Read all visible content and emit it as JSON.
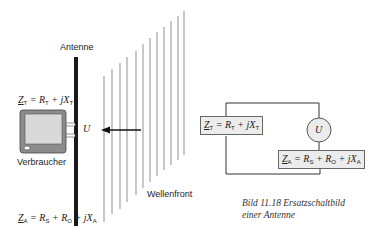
{
  "diagram": {
    "antenna_label": "Antenne",
    "consumer_label": "Verbraucher",
    "voltage_label": "U",
    "wavefront_label": "Wellenfront",
    "consumer_impedance": {
      "symbol": "Z",
      "sub": "T",
      "rhs": "= R",
      "rhs_sub": "T",
      "plus": " + jX",
      "plus_sub": "T"
    },
    "antenna_impedance": {
      "symbol": "Z",
      "sub": "A",
      "r1": "= R",
      "r1_sub": "S",
      "r2": " + R",
      "r2_sub": "O",
      "x": " + jX",
      "x_sub": "A"
    },
    "wavefront_line_count": 12
  },
  "circuit": {
    "source_label": "U",
    "left_box": "Z_T = R_T + jX_T",
    "right_box": "Z_A = R_S + R_O + jX_A"
  },
  "caption": {
    "line1": "Bild 11.18  Ersatzschaltbild",
    "line2": "einer Antenne"
  },
  "colors": {
    "antenna": "#1a1a1a",
    "wave_lines": "#9a9a9a",
    "box_fill": "#ececec",
    "tv_frame": "#8c8c8c",
    "tv_screen": "#d9d9d9"
  }
}
